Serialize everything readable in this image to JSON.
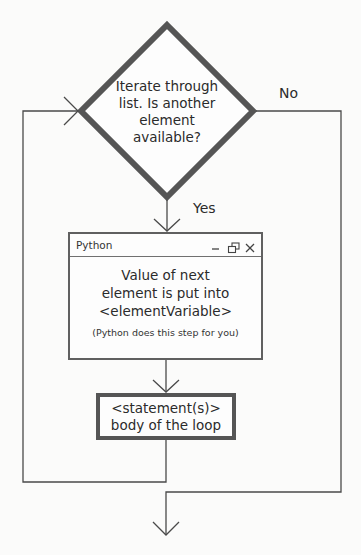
{
  "diagram": {
    "decision": {
      "text": "Iterate through list. Is another element available?",
      "lines": [
        "Iterate through",
        "list. Is another",
        "element",
        "available?"
      ]
    },
    "branches": {
      "no_label": "No",
      "yes_label": "Yes"
    },
    "python_window": {
      "title": "Python",
      "controls": [
        "minimize-icon",
        "restore-icon",
        "close-icon"
      ],
      "main_lines": [
        "Value of next",
        "element is put into",
        "<elementVariable>"
      ],
      "note": "(Python does this step for you)"
    },
    "statement_box": {
      "lines": [
        "<statement(s)>",
        "body of the loop"
      ]
    },
    "colors": {
      "shape_border": "#555555",
      "line": "#4a4a4a",
      "background": "#fbfbfa"
    }
  }
}
